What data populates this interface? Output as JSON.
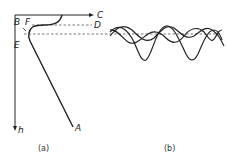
{
  "figure": {
    "panel_a": {
      "caption": "(a)",
      "labels": {
        "B": "B",
        "F": "F",
        "E": "E",
        "C": "C",
        "D": "D",
        "A": "A",
        "h": "h"
      }
    },
    "panel_b": {
      "caption": "(b)"
    },
    "colors": {
      "line": "#222222",
      "dashed": "#555555",
      "background": "#ffffff"
    }
  }
}
